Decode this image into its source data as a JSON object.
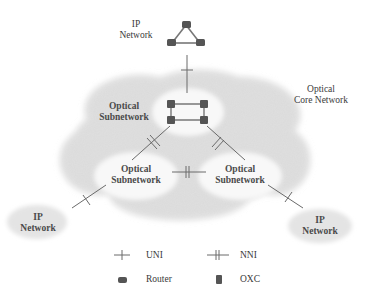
{
  "nodes": {
    "ip_top": {
      "line1": "IP",
      "line2": "Network"
    },
    "core": {
      "line1": "Optical",
      "line2": "Core Network"
    },
    "subnet_top": {
      "line1": "Optical",
      "line2": "Subnetwork"
    },
    "subnet_left": {
      "line1": "Optical",
      "line2": "Subnetwork"
    },
    "subnet_right": {
      "line1": "Optical",
      "line2": "Subnetwork"
    },
    "ip_left": {
      "line1": "IP",
      "line2": "Network"
    },
    "ip_right": {
      "line1": "IP",
      "line2": "Network"
    }
  },
  "links": [
    {
      "from": "ip_top",
      "to": "subnet_top",
      "type": "UNI"
    },
    {
      "from": "subnet_top",
      "to": "subnet_left",
      "type": "NNI"
    },
    {
      "from": "subnet_top",
      "to": "subnet_right",
      "type": "NNI"
    },
    {
      "from": "subnet_left",
      "to": "subnet_right",
      "type": "NNI"
    },
    {
      "from": "subnet_left",
      "to": "ip_left",
      "type": "UNI"
    },
    {
      "from": "subnet_right",
      "to": "ip_right",
      "type": "UNI"
    }
  ],
  "legend": {
    "uni": "UNI",
    "nni": "NNI",
    "router": "Router",
    "oxc": "OXC"
  },
  "colors": {
    "cloud": "#d9d9d9",
    "subnet": "#f7f7f7",
    "node": "#555555",
    "line": "#6a6a6a",
    "text": "#3a3a3a"
  }
}
